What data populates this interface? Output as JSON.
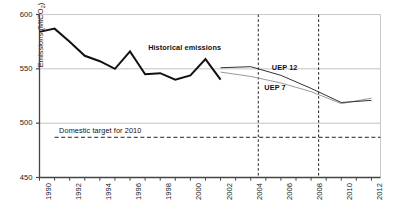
{
  "chart_data": {
    "type": "line",
    "title": "",
    "xlabel": "",
    "ylabel": "Emissions (MtCO2)",
    "ylabel_base": "Emissions (MtCO",
    "ylabel_sub": "2",
    "ylabel_tail": ")",
    "xlim": [
      1990,
      2012.6
    ],
    "ylim": [
      450,
      600
    ],
    "yticks": [
      450,
      500,
      550,
      600
    ],
    "ytick_labels": [
      "450",
      "500",
      "550",
      "600"
    ],
    "xticks": [
      1990,
      1991,
      1992,
      1993,
      1994,
      1995,
      1996,
      1997,
      1998,
      1999,
      2000,
      2001,
      2002,
      2003,
      2004,
      2005,
      2006,
      2007,
      2008,
      2009,
      2010,
      2011,
      2012
    ],
    "xtick_labels_shown": [
      "1990",
      "1992",
      "1994",
      "1996",
      "1998",
      "2000",
      "2002",
      "2004",
      "2006",
      "2008",
      "2010",
      "2012"
    ],
    "grid": "horizontal-major-only",
    "legend": "inline-annotations",
    "series": [
      {
        "name": "Historical emissions",
        "style": "solid-thick-black",
        "color": "#111111",
        "x": [
          1990,
          1991,
          1992,
          1993,
          1994,
          1995,
          1996,
          1997,
          1998,
          1999,
          2000,
          2001,
          2002
        ],
        "values": [
          584,
          587,
          575,
          562,
          557,
          550,
          566,
          545,
          546,
          540,
          544,
          559,
          540
        ]
      },
      {
        "name": "UEP 12",
        "style": "solid-thin-dark",
        "color": "#333333",
        "x": [
          2002,
          2004,
          2006,
          2008,
          2010,
          2012
        ],
        "values": [
          551,
          552,
          544,
          532,
          519,
          521
        ]
      },
      {
        "name": "UEP 7",
        "style": "solid-thin-grey",
        "color": "#9a9a9a",
        "x": [
          2002,
          2004,
          2006,
          2008,
          2010,
          2012
        ],
        "values": [
          547,
          543,
          537,
          529,
          518,
          523
        ]
      },
      {
        "name": "Domestic target for 2010",
        "style": "dashed-horizontal",
        "color": "#222222",
        "x": [
          1991,
          2012.6
        ],
        "values": [
          487,
          487
        ]
      }
    ],
    "vertical_markers": [
      {
        "name": "marker-2004",
        "x": 2004.5,
        "style": "dashed-vertical",
        "color": "#222222"
      },
      {
        "name": "marker-2008",
        "x": 2008.5,
        "style": "dashed-vertical",
        "color": "#222222"
      }
    ],
    "annotations": [
      {
        "name": "historical-emissions-label",
        "text": "Historical emissions",
        "x": 1997.2,
        "y": 569
      },
      {
        "name": "uep12-label",
        "text": "UEP 12",
        "x": 2005.4,
        "y": 551
      },
      {
        "name": "uep7-label",
        "text": "UEP 7",
        "x": 2004.9,
        "y": 532
      },
      {
        "name": "domestic-target-label",
        "text": "Domestic target for 2010",
        "x": 1991.3,
        "y": 493
      }
    ]
  },
  "axes": {
    "y_label_full": "Emissions (MtCO2)",
    "y_ticks": [
      "600",
      "550",
      "500",
      "450"
    ],
    "x_ticks": [
      "1990",
      "1992",
      "1994",
      "1996",
      "1998",
      "2000",
      "2002",
      "2004",
      "2006",
      "2008",
      "2010",
      "2012"
    ]
  },
  "annotations": {
    "historical": "Historical emissions",
    "uep12": "UEP 12",
    "uep7": "UEP 7",
    "target": "Domestic target for 2010"
  }
}
